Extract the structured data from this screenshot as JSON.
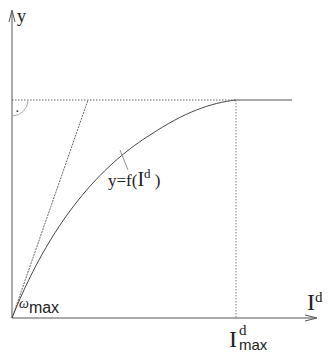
{
  "diagram": {
    "y_axis_label": "y",
    "x_axis_label_base": "I",
    "x_axis_label_sup": "d",
    "curve_label_prefix": "y=f(",
    "curve_label_var": "I",
    "curve_label_sup": "d",
    "curve_label_suffix": " )",
    "origin_label_symbol": "ω",
    "origin_label_sub": "max",
    "x_marker_base": "I",
    "x_marker_sup": "d",
    "x_marker_sub": "max",
    "right_angle_dot": "·"
  }
}
